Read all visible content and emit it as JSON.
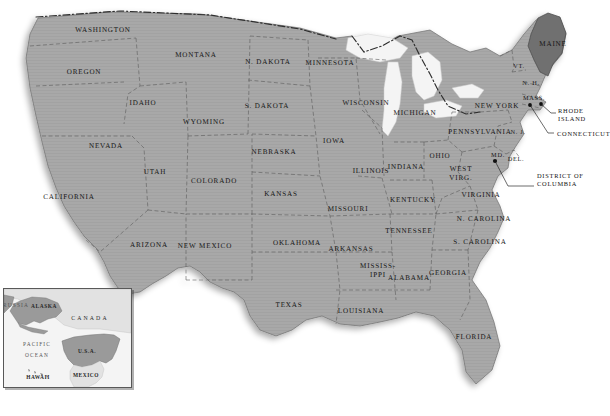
{
  "map": {
    "title": "United States of America",
    "projection_note": "contiguous-us-with-alaska-hawaii-inset",
    "colors": {
      "land_fill": "#a8a8a8",
      "land_stroke": "#6e6e6e",
      "highlight_fill": "#6f6f6f",
      "water_fill": "#f2f2f2",
      "background": "#ffffff",
      "label_text": "#141414",
      "border_dash": "#3a3a3a",
      "inset_background": "#f2f2f2",
      "inset_border": "#585858"
    },
    "highlighted_state": "MAINE",
    "states": [
      {
        "name": "WASHINGTON",
        "x": 103,
        "y": 30,
        "size": "normal"
      },
      {
        "name": "OREGON",
        "x": 84,
        "y": 72,
        "size": "normal"
      },
      {
        "name": "MONTANA",
        "x": 196,
        "y": 55,
        "size": "normal"
      },
      {
        "name": "N. DAKOTA",
        "x": 268,
        "y": 62,
        "size": "normal"
      },
      {
        "name": "MINNESOTA",
        "x": 330,
        "y": 63,
        "size": "normal"
      },
      {
        "name": "IDAHO",
        "x": 143,
        "y": 103,
        "size": "normal"
      },
      {
        "name": "WYOMING",
        "x": 204,
        "y": 122,
        "size": "normal"
      },
      {
        "name": "S. DAKOTA",
        "x": 267,
        "y": 106,
        "size": "normal"
      },
      {
        "name": "WISCONSIN",
        "x": 366,
        "y": 103,
        "size": "normal"
      },
      {
        "name": "MICHIGAN",
        "x": 415,
        "y": 113,
        "size": "normal"
      },
      {
        "name": "NEVADA",
        "x": 106,
        "y": 146,
        "size": "normal"
      },
      {
        "name": "UTAH",
        "x": 155,
        "y": 172,
        "size": "normal"
      },
      {
        "name": "NEBRASKA",
        "x": 274,
        "y": 152,
        "size": "normal"
      },
      {
        "name": "IOWA",
        "x": 334,
        "y": 141,
        "size": "normal"
      },
      {
        "name": "COLORADO",
        "x": 214,
        "y": 181,
        "size": "normal"
      },
      {
        "name": "KANSAS",
        "x": 281,
        "y": 194,
        "size": "normal"
      },
      {
        "name": "ILLINOIS",
        "x": 371,
        "y": 171,
        "size": "normal"
      },
      {
        "name": "INDIANA",
        "x": 406,
        "y": 167,
        "size": "normal"
      },
      {
        "name": "OHIO",
        "x": 440,
        "y": 156,
        "size": "normal"
      },
      {
        "name": "CALIFORNIA",
        "x": 69,
        "y": 197,
        "size": "normal"
      },
      {
        "name": "MISSOURI",
        "x": 348,
        "y": 209,
        "size": "normal"
      },
      {
        "name": "KENTUCKY",
        "x": 413,
        "y": 200,
        "size": "normal"
      },
      {
        "name": "VIRGINIA",
        "x": 481,
        "y": 195,
        "size": "normal"
      },
      {
        "name": "N. CAROLINA",
        "x": 484,
        "y": 219,
        "size": "normal"
      },
      {
        "name": "ARIZONA",
        "x": 149,
        "y": 245,
        "size": "normal"
      },
      {
        "name": "NEW MEXICO",
        "x": 205,
        "y": 246,
        "size": "normal"
      },
      {
        "name": "OKLAHOMA",
        "x": 297,
        "y": 243,
        "size": "normal"
      },
      {
        "name": "ARKANSAS",
        "x": 351,
        "y": 249,
        "size": "normal"
      },
      {
        "name": "TENNESSEE",
        "x": 409,
        "y": 231,
        "size": "normal"
      },
      {
        "name": "S. CAROLINA",
        "x": 480,
        "y": 242,
        "size": "normal"
      },
      {
        "name": "ALABAMA",
        "x": 409,
        "y": 278,
        "size": "normal"
      },
      {
        "name": "GEORGIA",
        "x": 448,
        "y": 273,
        "size": "normal"
      },
      {
        "name": "TEXAS",
        "x": 289,
        "y": 305,
        "size": "normal"
      },
      {
        "name": "LOUISIANA",
        "x": 361,
        "y": 311,
        "size": "normal"
      },
      {
        "name": "FLORIDA",
        "x": 474,
        "y": 337,
        "size": "normal"
      },
      {
        "name": "NEW YORK",
        "x": 497,
        "y": 106,
        "size": "normal"
      },
      {
        "name": "PENNSYLVANIA",
        "x": 480,
        "y": 132,
        "size": "normal"
      },
      {
        "name": "MAINE",
        "x": 553,
        "y": 44,
        "size": "normal"
      },
      {
        "name": "MASS.",
        "x": 534,
        "y": 99,
        "size": "sm"
      },
      {
        "name": "VT.",
        "x": 519,
        "y": 67,
        "size": "sm"
      },
      {
        "name": "N. H.",
        "x": 531,
        "y": 84,
        "size": "sm"
      },
      {
        "name": "N. J.",
        "x": 518,
        "y": 133,
        "size": "sm"
      },
      {
        "name": "MD.",
        "x": 498,
        "y": 156,
        "size": "sm"
      },
      {
        "name": "DEL.",
        "x": 516,
        "y": 160,
        "size": "sm"
      }
    ],
    "multiline_states": [
      {
        "lines": [
          "MISSISS-",
          "IPPI"
        ],
        "x": 378,
        "y": 271,
        "size": "normal"
      },
      {
        "lines": [
          "WEST",
          "VIRG."
        ],
        "x": 461,
        "y": 174,
        "size": "normal"
      },
      {
        "lines": [
          "RHODE",
          "ISLAND"
        ],
        "x": 0,
        "y": 0,
        "size": "normal"
      }
    ],
    "callouts": [
      {
        "label": "RHODE ISLAND",
        "lines": [
          "RHODE",
          "ISLAND"
        ],
        "text_x": 558,
        "text_y": 115,
        "dot_x": 541,
        "dot_y": 104,
        "leader": "M 541 104 L 553 113"
      },
      {
        "label": "CONNECTICUT",
        "lines": [
          "CONNECTICUT"
        ],
        "text_x": 557,
        "text_y": 134,
        "dot_x": 530,
        "dot_y": 105,
        "leader": "M 530 105 L 553 133"
      },
      {
        "label": "DISTRICT OF COLUMBIA",
        "lines": [
          "DISTRICT OF",
          "COLUMBIA"
        ],
        "text_x": 537,
        "text_y": 180,
        "dot_x": 495,
        "dot_y": 161,
        "leader": "M 495 161 L 506 188 L 533 188"
      }
    ]
  },
  "inset": {
    "title": "Alaska / Hawaii locator inset",
    "labels": [
      {
        "text": "RUSSIA",
        "x": 12,
        "y": 16,
        "style": "thin"
      },
      {
        "text": "ALASKA",
        "x": 40,
        "y": 17,
        "style": "bold"
      },
      {
        "text": "CANADA",
        "x": 86,
        "y": 29,
        "style": "wide"
      },
      {
        "text": "PACIFIC",
        "x": 33,
        "y": 55,
        "style": "thin"
      },
      {
        "text": "OCEAN",
        "x": 33,
        "y": 66,
        "style": "thin"
      },
      {
        "text": "U.S.A.",
        "x": 83,
        "y": 62,
        "style": "bold"
      },
      {
        "text": "MEXICO",
        "x": 82,
        "y": 86,
        "style": "bold"
      },
      {
        "text": "HAWAII",
        "x": 34,
        "y": 88,
        "style": "bold"
      }
    ]
  }
}
